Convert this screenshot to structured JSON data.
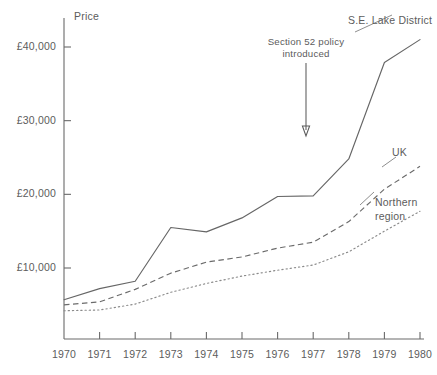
{
  "chart_data": {
    "type": "line",
    "title": "",
    "xlabel": "",
    "ylabel": "Price",
    "x": [
      1970,
      1971,
      1972,
      1973,
      1974,
      1975,
      1976,
      1977,
      1978,
      1979,
      1980
    ],
    "xtick_labels": [
      "1970",
      "1971",
      "1972",
      "1973",
      "1974",
      "1975",
      "1976",
      "1977",
      "1978",
      "1979",
      "1980"
    ],
    "xlim": [
      1970,
      1980
    ],
    "ylim": [
      0,
      44000
    ],
    "ytick_values": [
      10000,
      20000,
      30000,
      40000
    ],
    "ytick_labels": [
      "£10,000",
      "£20,000",
      "£30,000",
      "£40,000"
    ],
    "grid": false,
    "legend_position": "inline-right-of-lines",
    "currency_symbol": "£",
    "series": [
      {
        "name": "S.E. Lake District",
        "style": "solid",
        "color": "#666666",
        "values": [
          5700,
          7200,
          8200,
          15500,
          14900,
          16800,
          19700,
          19800,
          24800,
          37900,
          41000
        ]
      },
      {
        "name": "UK",
        "style": "dashed",
        "color": "#6b6b6b",
        "values": [
          5000,
          5400,
          7100,
          9300,
          10800,
          11500,
          12700,
          13500,
          16300,
          20700,
          23800
        ]
      },
      {
        "name": "Northern region",
        "style": "dotted",
        "color": "#8a8a8a",
        "values": [
          4200,
          4300,
          5100,
          6700,
          7900,
          8900,
          9700,
          10400,
          12200,
          15000,
          17700
        ]
      }
    ],
    "annotations": [
      {
        "text_line1": "Section 52 policy",
        "text_line2": "introduced",
        "arrow": "down-arrow",
        "x_year": 1977,
        "points_to_value": 29500
      }
    ]
  },
  "series_labels": {
    "lake_district": "S.E. Lake District",
    "uk": "UK",
    "northern_line1": "Northern",
    "northern_line2": "region"
  }
}
